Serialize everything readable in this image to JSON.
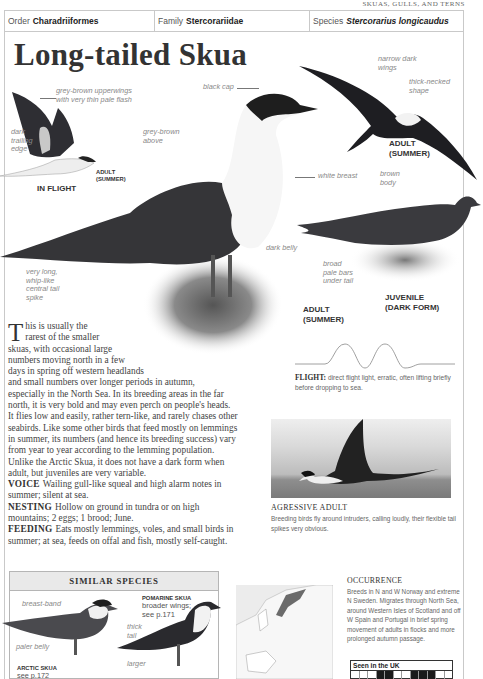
{
  "running_head": "SKUAS, GULLS, AND TERNS",
  "taxonomy": {
    "order_label": "Order",
    "order_value": "Charadriiformes",
    "family_label": "Family",
    "family_value": "Stercorariidae",
    "species_label": "Species",
    "species_value": "Stercorarius longicaudus"
  },
  "title": "Long-tailed Skua",
  "illustrations": {
    "in_flight": {
      "caption": "IN FLIGHT",
      "sub_caption_1": "ADULT",
      "sub_caption_2": "(SUMMER)",
      "labels": {
        "upperwings_1": "grey-brown upperwings",
        "upperwings_2": "with very thin pale flash",
        "trailing_1": "dark",
        "trailing_2": "trailing",
        "trailing_3": "edge"
      }
    },
    "standing_adult": {
      "caption_1": "ADULT",
      "caption_2": "(SUMMER)",
      "labels": {
        "black_cap": "black cap",
        "above_1": "grey-brown",
        "above_2": "above",
        "white_breast": "white breast",
        "dark_belly": "dark belly",
        "tail_1": "very long,",
        "tail_2": "whip-like",
        "tail_3": "central tail",
        "tail_4": "spike"
      }
    },
    "flying_adult": {
      "caption_1": "ADULT",
      "caption_2": "(SUMMER)",
      "labels": {
        "wings_1": "narrow dark",
        "wings_2": "wings",
        "neck_1": "thick-necked",
        "neck_2": "shape"
      }
    },
    "juvenile": {
      "caption_1": "JUVENILE",
      "caption_2": "(DARK FORM)",
      "labels": {
        "body_1": "brown",
        "body_2": "body",
        "bars_1": "broad",
        "bars_2": "pale bars",
        "bars_3": "under tail"
      }
    }
  },
  "body": {
    "dropcap": "T",
    "lines": [
      "his is usually the",
      "rarest of the smaller",
      "skuas, with occasional large",
      "numbers moving north in a few",
      "days in spring off western headlands",
      "and small numbers over longer periods in autumn,",
      "especially in the North Sea. In its breeding areas in the far",
      "north, it is very bold and may even perch on people's heads.",
      "It flies low and easily, rather tern-like, and rarely chases other",
      "seabirds. Like some other birds that feed mostly on lemmings",
      "in summer, its numbers (and hence its breeding success) vary",
      "from year to year according to the lemming population.",
      "Unlike the Arctic Skua, it does not have a dark form when",
      "adult, but juveniles are very variable."
    ],
    "voice_head": "VOICE",
    "voice_1": "Wailing gull-like squeal and high alarm notes in",
    "voice_2": "summer; silent at sea.",
    "nesting_head": "NESTING",
    "nesting_1": "Hollow on ground in tundra or on high",
    "nesting_2": "mountains; 2 eggs; 1 brood; June.",
    "feeding_head": "FEEDING",
    "feeding_1": "Eats mostly lemmings, voles, and small birds in",
    "feeding_2": "summer; at sea, feeds on offal and fish, mostly self-caught."
  },
  "flight": {
    "head": "FLIGHT:",
    "text": "direct flight light, erratic, often lifting briefly before dropping to sea."
  },
  "photo": {
    "head": "AGRESSIVE ADULT",
    "caption": "Breeding birds fly around intruders, calling loudly, their flexible tail spikes very obvious."
  },
  "similar_species": {
    "title": "SIMILAR SPECIES",
    "arctic": {
      "name": "ARCTIC SKUA",
      "ref": "see p.172",
      "label_breast": "breast-band",
      "label_belly": "paler belly"
    },
    "pomarine": {
      "name": "POMARINE SKUA",
      "desc_1": "broader wings;",
      "desc_2": "see p.171",
      "label_tail_1": "thick",
      "label_tail_2": "tail",
      "label_larger": "larger"
    }
  },
  "occurrence": {
    "head": "OCCURRENCE",
    "text": "Breeds in N and W Norway and extreme N Sweden. Migrates through North Sea, around Western Isles of Scotland and off W Spain and Portugal in brief spring movement of adults in flocks and more prolonged autumn passage.",
    "seen_label": "Seen in the UK",
    "months": [
      "J",
      "F",
      "M",
      "A",
      "M",
      "J",
      "J",
      "A",
      "S",
      "O",
      "N",
      "D"
    ],
    "months_present": [
      false,
      false,
      false,
      true,
      true,
      false,
      false,
      true,
      true,
      true,
      false,
      false
    ]
  },
  "colors": {
    "border": "#c9c9c9",
    "label_grey": "#888888",
    "text": "#444444"
  }
}
